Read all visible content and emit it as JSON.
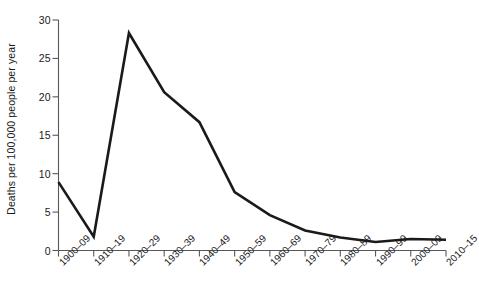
{
  "chart_data": {
    "type": "line",
    "title": "",
    "subtitle": "",
    "xlabel": "",
    "ylabel": "Deaths per 100,000 people per year",
    "categories": [
      "1900–09",
      "1910–19",
      "1920–29",
      "1930–39",
      "1940–49",
      "1950–59",
      "1960–69",
      "1970–79",
      "1980–89",
      "1990–99",
      "2000–09",
      "2010–15"
    ],
    "values": [
      8.9,
      1.8,
      28.3,
      20.6,
      16.7,
      7.6,
      4.6,
      2.6,
      1.7,
      1.1,
      1.5,
      1.4
    ],
    "series": [
      {
        "name": "Deaths per 100,000 people per year",
        "values": [
          8.9,
          1.8,
          28.3,
          20.6,
          16.7,
          7.6,
          4.6,
          2.6,
          1.7,
          1.1,
          1.5,
          1.4
        ]
      }
    ],
    "ylim": [
      0,
      30
    ],
    "ytick_labels": [
      "0",
      "5",
      "10",
      "15",
      "20",
      "25",
      "30"
    ],
    "ytick_values": [
      0,
      5,
      10,
      15,
      20,
      25,
      30
    ],
    "grid": false,
    "legend": "none",
    "line_color": "#1a1a1a",
    "axis_color": "#58585a",
    "background_color": "#ffffff"
  }
}
